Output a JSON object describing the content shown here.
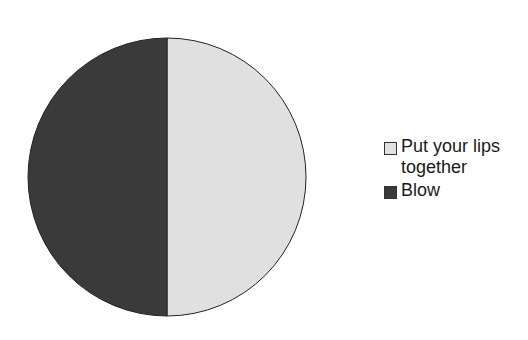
{
  "chart_data": {
    "type": "pie",
    "title": "",
    "categories": [
      "Put your lips together",
      "Blow"
    ],
    "values": [
      50,
      50
    ],
    "colors": [
      "#e0e0e0",
      "#3a3a3a"
    ],
    "start_angle_deg": 90,
    "direction": "clockwise",
    "legend_position": "right",
    "legend": [
      {
        "label": "Put your lips together",
        "color": "#e0e0e0"
      },
      {
        "label": "Blow",
        "color": "#3a3a3a"
      }
    ]
  }
}
